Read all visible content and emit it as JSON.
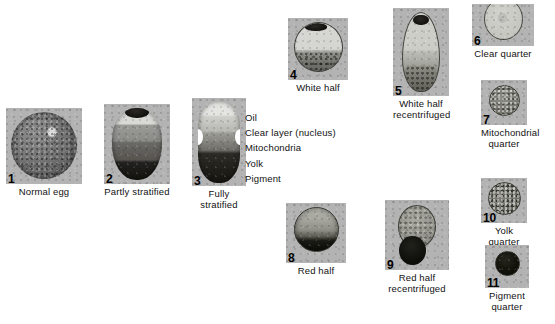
{
  "figure": {
    "legend": {
      "items": [
        "Oil",
        "Clear layer (nucleus)",
        "Mitochondria",
        "Yolk",
        "Pigment"
      ]
    },
    "source_note": "",
    "panels": [
      {
        "number": "1",
        "caption": "Normal egg"
      },
      {
        "number": "2",
        "caption": "Partly stratified"
      },
      {
        "number": "3",
        "caption": "Fully stratified"
      },
      {
        "number": "4",
        "caption": "White half"
      },
      {
        "number": "5",
        "caption": "White half\nrecentrifuged"
      },
      {
        "number": "6",
        "caption": "Clear quarter"
      },
      {
        "number": "7",
        "caption": "Mitochondrial\nquarter"
      },
      {
        "number": "8",
        "caption": "Red half"
      },
      {
        "number": "9",
        "caption": "Red half\nrecentrifuged"
      },
      {
        "number": "10",
        "caption": "Yolk quarter"
      },
      {
        "number": "11",
        "caption": "Pigment\nquarter"
      }
    ]
  }
}
